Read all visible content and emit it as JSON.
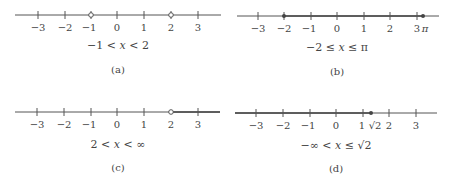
{
  "figure": {
    "panels": [
      {
        "id": "a",
        "caption": "(a)",
        "inequality": {
          "left": "−1 <",
          "var": "x",
          "right": "< 2"
        },
        "ticks": [
          "−3",
          "−2",
          "−1",
          "0",
          "1",
          "2",
          "3"
        ],
        "endpoints": [
          {
            "value": "−1",
            "type": "open"
          },
          {
            "value": "2",
            "type": "open"
          }
        ]
      },
      {
        "id": "b",
        "caption": "(b)",
        "inequality": {
          "left": "−2 ≤",
          "var": "x",
          "right": "≤ π"
        },
        "ticks": [
          "−3",
          "−2",
          "−1",
          "0",
          "1",
          "2",
          "3"
        ],
        "extra_label": "π",
        "endpoints": [
          {
            "value": "−2",
            "type": "closed"
          },
          {
            "value": "π",
            "type": "closed"
          }
        ]
      },
      {
        "id": "c",
        "caption": "(c)",
        "inequality": {
          "left": "2 <",
          "var": "x",
          "right": "< ∞"
        },
        "ticks": [
          "−3",
          "−2",
          "−1",
          "0",
          "1",
          "2",
          "3"
        ],
        "endpoints": [
          {
            "value": "2",
            "type": "open"
          }
        ]
      },
      {
        "id": "d",
        "caption": "(d)",
        "inequality": {
          "left": "−∞ <",
          "var": "x",
          "right": "≤ √2"
        },
        "ticks": [
          "−3",
          "−2",
          "−1",
          "0",
          "1",
          "2",
          "3"
        ],
        "extra_label": "√2",
        "endpoints": [
          {
            "value": "√2",
            "type": "closed"
          }
        ]
      }
    ]
  }
}
